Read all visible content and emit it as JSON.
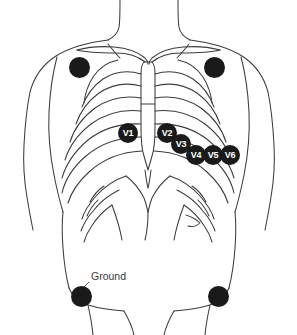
{
  "diagram": {
    "background_color": "#ffffff",
    "outline_color": "#3c3c3c",
    "electrode_color": "#1a1a1a",
    "electrode_label_color": "#ffffff",
    "annotation_color": "#3a3a3a"
  },
  "electrodes": [
    {
      "id": "limb-right-arm",
      "label": "",
      "kind": "limb",
      "x": 79,
      "y": 67,
      "radius": 10.5,
      "has_label": false
    },
    {
      "id": "limb-left-arm",
      "label": "",
      "kind": "limb",
      "x": 214,
      "y": 67,
      "radius": 10.5,
      "has_label": false
    },
    {
      "id": "precordial-v1",
      "label": "V1",
      "kind": "precordial",
      "x": 128,
      "y": 133,
      "radius": 10,
      "has_label": true
    },
    {
      "id": "precordial-v2",
      "label": "V2",
      "kind": "precordial",
      "x": 167,
      "y": 133,
      "radius": 10,
      "has_label": true
    },
    {
      "id": "precordial-v3",
      "label": "V3",
      "kind": "precordial",
      "x": 181,
      "y": 144,
      "radius": 10,
      "has_label": true
    },
    {
      "id": "precordial-v4",
      "label": "V4",
      "kind": "precordial",
      "x": 196,
      "y": 155,
      "radius": 10,
      "has_label": true
    },
    {
      "id": "precordial-v5",
      "label": "V5",
      "kind": "precordial",
      "x": 213,
      "y": 155,
      "radius": 10,
      "has_label": true
    },
    {
      "id": "precordial-v6",
      "label": "V6",
      "kind": "precordial",
      "x": 230,
      "y": 155,
      "radius": 10,
      "has_label": true
    },
    {
      "id": "limb-right-leg-ground",
      "label": "",
      "kind": "limb",
      "x": 81,
      "y": 296,
      "radius": 10.5,
      "has_label": false
    },
    {
      "id": "limb-left-leg",
      "label": "",
      "kind": "limb",
      "x": 218,
      "y": 296,
      "radius": 10.5,
      "has_label": false
    }
  ],
  "annotations": [
    {
      "id": "ground-annotation",
      "text": "Ground",
      "text_x": 91,
      "text_y": 270,
      "leader_from_x": 89,
      "leader_from_y": 282,
      "leader_to_x": 81,
      "leader_to_y": 290
    }
  ]
}
